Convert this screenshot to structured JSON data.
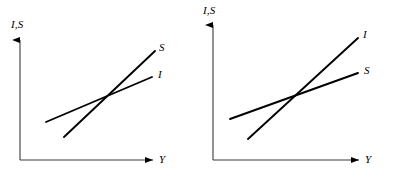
{
  "figure": {
    "type": "diagram",
    "background_color": "#ffffff",
    "line_color": "#000000",
    "axis_color": "#000000",
    "panels": [
      {
        "id": "left-panel",
        "axes": {
          "y_label": "I,S",
          "x_label": "Y",
          "origin": {
            "x": 20,
            "y": 160
          },
          "y_top": {
            "x": 20,
            "y": 37
          },
          "x_right": {
            "x": 157,
            "y": 160
          },
          "arrowheads": [
            "y-axis-up",
            "x-axis-right"
          ]
        },
        "curves": [
          {
            "name": "S",
            "label": "S",
            "role": "saving-schedule",
            "slope_class": "steep",
            "start": {
              "x": 64,
              "y": 137
            },
            "end": {
              "x": 155,
              "y": 51
            },
            "label_pos": {
              "x": 159,
              "y": 43
            }
          },
          {
            "name": "I",
            "label": "I",
            "role": "investment-schedule",
            "slope_class": "flat",
            "start": {
              "x": 46,
              "y": 122
            },
            "end": {
              "x": 152,
              "y": 77
            },
            "label_pos": {
              "x": 157,
              "y": 70
            }
          }
        ],
        "intersection": {
          "x": 103,
          "y": 103
        }
      },
      {
        "id": "right-panel",
        "axes": {
          "y_label": "I,S",
          "x_label": "Y",
          "origin": {
            "x": 16,
            "y": 160
          },
          "y_top": {
            "x": 16,
            "y": 22
          },
          "x_right": {
            "x": 166,
            "y": 160
          },
          "arrowheads": [
            "y-axis-up",
            "x-axis-right"
          ]
        },
        "curves": [
          {
            "name": "I",
            "label": "I",
            "role": "investment-schedule",
            "slope_class": "steep",
            "start": {
              "x": 51,
              "y": 139
            },
            "end": {
              "x": 161,
              "y": 38
            },
            "label_pos": {
              "x": 165,
              "y": 30
            }
          },
          {
            "name": "S",
            "label": "S",
            "role": "saving-schedule",
            "slope_class": "flat",
            "start": {
              "x": 33,
              "y": 119
            },
            "end": {
              "x": 161,
              "y": 73
            },
            "label_pos": {
              "x": 166,
              "y": 66
            }
          }
        ],
        "intersection": {
          "x": 105,
          "y": 100
        }
      }
    ]
  }
}
